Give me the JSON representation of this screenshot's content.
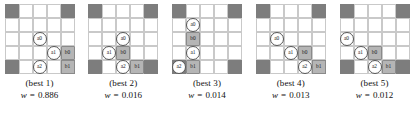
{
  "figure": {
    "grid_size": 5,
    "colors": {
      "dark_cell": "#7d7d7d",
      "empty_cell": "#ffffff",
      "grid_line": "#c9c9c9",
      "agent_fill": "#ffffff",
      "agent_stroke": "#555555",
      "box_fill": "#b5b5b5",
      "box_stroke": "#8a8a8a",
      "text": "#111111"
    },
    "weight_symbol": "w",
    "equals": "="
  },
  "panels": [
    {
      "caption": "(best 1)",
      "weight": "0.886",
      "dark_cells": [
        [
          0,
          0
        ],
        [
          0,
          4
        ],
        [
          4,
          0
        ],
        [
          4,
          4
        ]
      ],
      "markers": [
        {
          "label": "a0",
          "type": "agent",
          "row": 2,
          "col": 2
        },
        {
          "label": "a1",
          "type": "agent",
          "row": 3,
          "col": 3
        },
        {
          "label": "b0",
          "type": "box",
          "row": 3,
          "col": 4
        },
        {
          "label": "a2",
          "type": "agent",
          "row": 4,
          "col": 2
        },
        {
          "label": "b1",
          "type": "box",
          "row": 4,
          "col": 4
        }
      ]
    },
    {
      "caption": "(best 2)",
      "weight": "0.016",
      "dark_cells": [
        [
          0,
          0
        ],
        [
          0,
          4
        ],
        [
          4,
          0
        ],
        [
          4,
          4
        ]
      ],
      "markers": [
        {
          "label": "a0",
          "type": "agent",
          "row": 2,
          "col": 2
        },
        {
          "label": "a1",
          "type": "agent",
          "row": 3,
          "col": 1
        },
        {
          "label": "b0",
          "type": "box",
          "row": 3,
          "col": 2
        },
        {
          "label": "a2",
          "type": "agent",
          "row": 4,
          "col": 2
        },
        {
          "label": "b1",
          "type": "box",
          "row": 4,
          "col": 3
        }
      ]
    },
    {
      "caption": "(best 3)",
      "weight": "0.014",
      "dark_cells": [
        [
          0,
          0
        ],
        [
          0,
          4
        ],
        [
          4,
          0
        ],
        [
          4,
          4
        ]
      ],
      "markers": [
        {
          "label": "a0",
          "type": "agent",
          "row": 1,
          "col": 1
        },
        {
          "label": "b0",
          "type": "box",
          "row": 2,
          "col": 1
        },
        {
          "label": "a1",
          "type": "agent",
          "row": 3,
          "col": 1
        },
        {
          "label": "a2",
          "type": "agent",
          "row": 4,
          "col": 0
        },
        {
          "label": "b1",
          "type": "box",
          "row": 4,
          "col": 1
        }
      ]
    },
    {
      "caption": "(best 4)",
      "weight": "0.013",
      "dark_cells": [
        [
          0,
          0
        ],
        [
          0,
          4
        ],
        [
          4,
          0
        ],
        [
          4,
          4
        ]
      ],
      "markers": [
        {
          "label": "a0",
          "type": "agent",
          "row": 2,
          "col": 1
        },
        {
          "label": "a1",
          "type": "agent",
          "row": 3,
          "col": 2
        },
        {
          "label": "b0",
          "type": "box",
          "row": 3,
          "col": 3
        },
        {
          "label": "a2",
          "type": "agent",
          "row": 4,
          "col": 3
        },
        {
          "label": "b1",
          "type": "box",
          "row": 4,
          "col": 4
        }
      ]
    },
    {
      "caption": "(best 5)",
      "weight": "0.012",
      "dark_cells": [
        [
          0,
          0
        ],
        [
          0,
          4
        ],
        [
          4,
          0
        ],
        [
          4,
          4
        ]
      ],
      "markers": [
        {
          "label": "a0",
          "type": "agent",
          "row": 2,
          "col": 0
        },
        {
          "label": "a1",
          "type": "agent",
          "row": 3,
          "col": 1
        },
        {
          "label": "b0",
          "type": "box",
          "row": 3,
          "col": 2
        },
        {
          "label": "a2",
          "type": "agent",
          "row": 4,
          "col": 2
        },
        {
          "label": "b1",
          "type": "box",
          "row": 4,
          "col": 3
        }
      ]
    }
  ]
}
